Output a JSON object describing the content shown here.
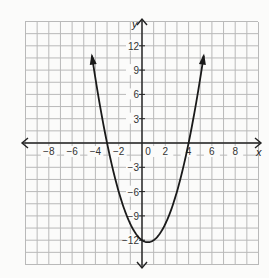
{
  "chart_data": {
    "type": "line",
    "title": "",
    "xlabel": "x",
    "ylabel": "y",
    "xlim": [
      -10,
      10
    ],
    "ylim": [
      -15,
      15
    ],
    "grid": true,
    "grid_step_x": 1,
    "grid_step_y": 1.5,
    "x_ticks": [
      -8,
      -6,
      -4,
      -2,
      0,
      2,
      4,
      6,
      8
    ],
    "x_tick_labels": [
      "−8",
      "−6",
      "−4",
      "−2",
      "0",
      "2",
      "4",
      "6",
      "8"
    ],
    "y_ticks": [
      12,
      9,
      6,
      3,
      -3,
      -6,
      -9,
      -12
    ],
    "y_tick_labels": [
      "12",
      "9",
      "6",
      "3",
      "−3",
      "−6",
      "−9",
      "−12"
    ],
    "series": [
      {
        "name": "parabola",
        "equation": "y = x^2 - x - 12",
        "x": [
          -4.3,
          -4,
          -3,
          -2,
          -1,
          0,
          0.5,
          1,
          2,
          3,
          4,
          5,
          5.3
        ],
        "values": [
          10.79,
          8,
          0,
          -6,
          -10,
          -12,
          -12.25,
          -12,
          -10,
          -6,
          0,
          8,
          10.79
        ],
        "color": "#1a1a1a",
        "arrows_at_ends": true
      }
    ],
    "features": {
      "vertex": [
        0.5,
        -12.25
      ],
      "x_intercepts": [
        -3,
        4
      ],
      "y_intercept": -12
    }
  },
  "colors": {
    "grid": "#b9b9b9",
    "axis": "#222222",
    "curve": "#1a1a1a",
    "background": "#fbfbfa"
  }
}
